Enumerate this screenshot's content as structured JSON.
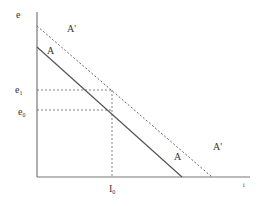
{
  "diagram": {
    "axes": {
      "y_label": "e",
      "x_label": "i"
    },
    "lines": [
      {
        "name": "A",
        "style": "solid",
        "label_top": "A",
        "label_bottom": "A"
      },
      {
        "name": "A'",
        "style": "dashed",
        "label_top": "A'",
        "label_bottom": "A'"
      }
    ],
    "levels": {
      "e1": {
        "base": "e",
        "sub": "1"
      },
      "e0": {
        "base": "e",
        "sub": "0"
      },
      "i0": {
        "base": "I",
        "sub": "0"
      }
    },
    "colors": {
      "line": "#555555",
      "axis": "#777777"
    }
  }
}
